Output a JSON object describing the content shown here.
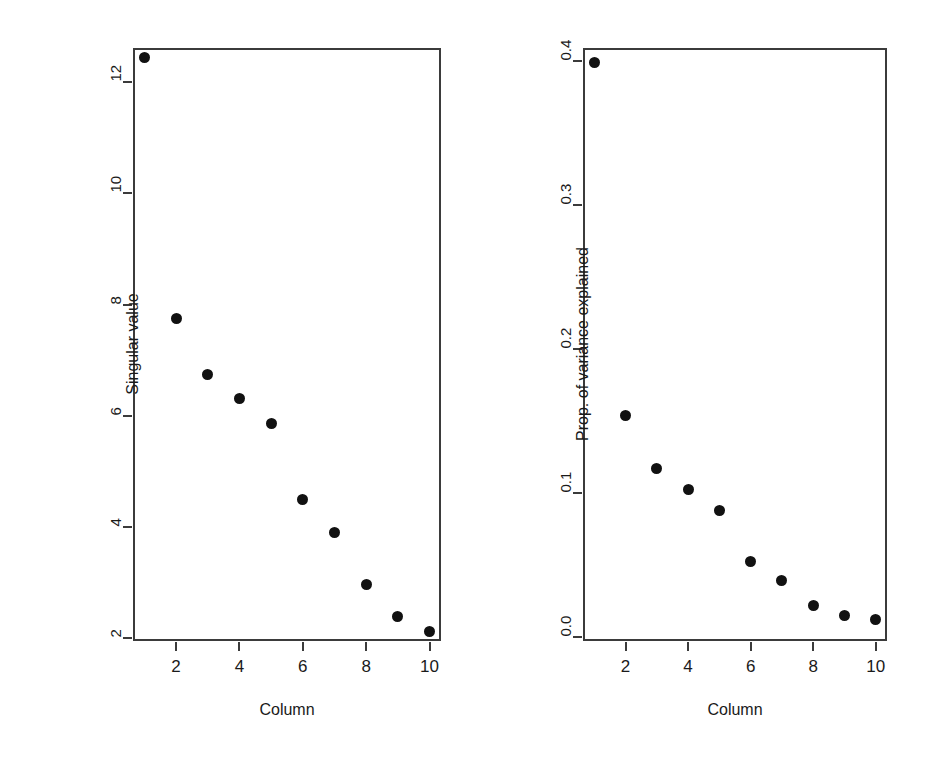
{
  "figure": {
    "background": "#ffffff",
    "point_color": "#111111",
    "axis_color": "#3b3b3b"
  },
  "chart_data": [
    {
      "id": "singular-value-scree",
      "type": "scatter",
      "title": "",
      "xlabel": "Column",
      "ylabel": "Singular value",
      "x": [
        1,
        2,
        3,
        4,
        5,
        6,
        7,
        8,
        9,
        10
      ],
      "values": [
        12.44,
        7.74,
        6.74,
        6.3,
        5.85,
        4.48,
        3.9,
        2.95,
        2.38,
        2.12
      ],
      "xlim": [
        0.64,
        10.36
      ],
      "ylim": [
        1.94,
        12.62
      ],
      "xticks": [
        2,
        4,
        6,
        8,
        10
      ],
      "xticklabels": [
        "2",
        "4",
        "6",
        "8",
        "10"
      ],
      "yticks": [
        2,
        4,
        6,
        8,
        10,
        12
      ],
      "yticklabels": [
        "2",
        "4",
        "6",
        "8",
        "10",
        "12"
      ],
      "grid": false,
      "legend": "none"
    },
    {
      "id": "proportion-variance-scree",
      "type": "scatter",
      "title": "",
      "xlabel": "Column",
      "ylabel": "Prop. of variance explained",
      "x": [
        1,
        2,
        3,
        4,
        5,
        6,
        7,
        8,
        9,
        10
      ],
      "values": [
        0.399,
        0.154,
        0.117,
        0.102,
        0.088,
        0.052,
        0.039,
        0.022,
        0.015,
        0.012
      ],
      "xlim": [
        0.64,
        10.36
      ],
      "ylim": [
        -0.003,
        0.409
      ],
      "xticks": [
        2,
        4,
        6,
        8,
        10
      ],
      "xticklabels": [
        "2",
        "4",
        "6",
        "8",
        "10"
      ],
      "yticks": [
        0.0,
        0.1,
        0.2,
        0.3,
        0.4
      ],
      "yticklabels": [
        "0.0",
        "0.1",
        "0.2",
        "0.3",
        "0.4"
      ],
      "grid": false,
      "legend": "none"
    }
  ],
  "panels": {
    "left": {
      "name": "Singular value scree plot",
      "y_axis_title": "Singular value",
      "x_axis_title": "Column",
      "y_tick_labels": [
        "2",
        "4",
        "6",
        "8",
        "10",
        "12"
      ],
      "x_tick_labels": [
        "2",
        "4",
        "6",
        "8",
        "10"
      ]
    },
    "right": {
      "name": "Proportion of variance explained scree plot",
      "y_axis_title": "Prop. of variance explained",
      "x_axis_title": "Column",
      "y_tick_labels": [
        "0.0",
        "0.1",
        "0.2",
        "0.3",
        "0.4"
      ],
      "x_tick_labels": [
        "2",
        "4",
        "6",
        "8",
        "10"
      ]
    }
  }
}
